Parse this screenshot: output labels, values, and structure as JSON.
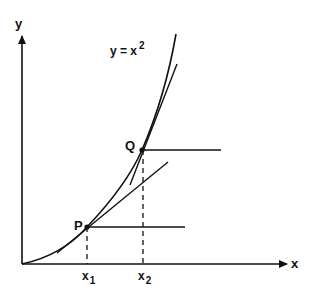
{
  "diagram": {
    "axis_labels": {
      "x": "x",
      "y": "y"
    },
    "equation": {
      "base": "y = x",
      "exponent": "2"
    },
    "points": {
      "P": {
        "label": "P",
        "tick_label": "x",
        "tick_sub": "1"
      },
      "Q": {
        "label": "Q",
        "tick_label": "x",
        "tick_sub": "2"
      }
    },
    "colors": {
      "ink": "#111111",
      "background": "#ffffff"
    }
  }
}
